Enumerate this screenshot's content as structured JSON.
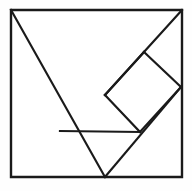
{
  "figure": {
    "name": "tangram-dissection-square",
    "background_color": "#fefefe",
    "line_color": "#1a1a1a",
    "line_width": 2.2,
    "canvas": {
      "width": 192,
      "height": 191
    }
  },
  "geometry": {
    "square": {
      "name": "outer-square",
      "points": "11,10 182,10 182,177 11,177",
      "top_left": [
        11,
        10
      ],
      "top_right": [
        182,
        10
      ],
      "bottom_right": [
        182,
        177
      ],
      "bottom_left": [
        11,
        177
      ]
    },
    "vertices": {
      "top_left": [
        11,
        10
      ],
      "top_right": [
        182,
        10
      ],
      "bottom_left": [
        11,
        177
      ],
      "bottom_right": [
        182,
        177
      ],
      "center_cross": [
        105,
        95
      ],
      "diamond_top": [
        144,
        52
      ],
      "diamond_right": [
        181,
        87
      ],
      "diamond_bottom": [
        140,
        132
      ],
      "diamond_left": [
        105,
        95
      ],
      "bar_left": [
        60,
        131
      ],
      "bottom_edge_split": [
        105,
        177
      ]
    },
    "segments": [
      {
        "name": "large-diagonal-top-left-to-bottom-edge",
        "from": [
          11,
          10
        ],
        "to": [
          105,
          177
        ]
      },
      {
        "name": "large-diagonal-top-right-to-center",
        "from": [
          182,
          10
        ],
        "to": [
          105,
          95
        ]
      },
      {
        "name": "diamond-top-right-edge",
        "from": [
          144,
          52
        ],
        "to": [
          181,
          87
        ]
      },
      {
        "name": "diamond-bottom-right-edge",
        "from": [
          181,
          87
        ],
        "to": [
          140,
          132
        ]
      },
      {
        "name": "diamond-bottom-left-edge",
        "from": [
          140,
          132
        ],
        "to": [
          105,
          95
        ]
      },
      {
        "name": "diamond-top-left-edge",
        "from": [
          105,
          95
        ],
        "to": [
          144,
          52
        ]
      },
      {
        "name": "horizontal-bar",
        "from": [
          60,
          131
        ],
        "to": [
          140,
          132
        ]
      },
      {
        "name": "lower-diagonal-to-right-vertex",
        "from": [
          105,
          177
        ],
        "to": [
          181,
          87
        ]
      }
    ]
  }
}
